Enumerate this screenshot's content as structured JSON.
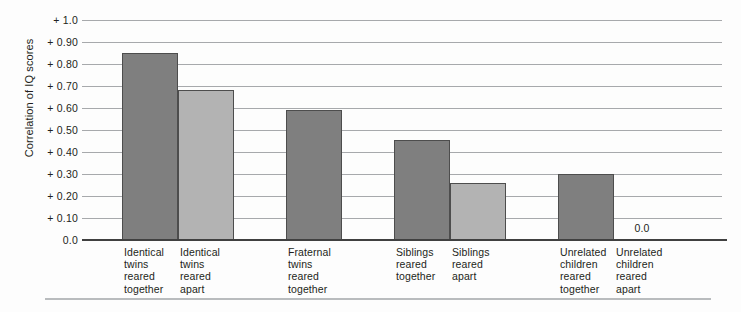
{
  "chart_data": {
    "type": "bar",
    "title": "",
    "xlabel": "",
    "ylabel": "Correlation of IQ scores",
    "ylim": [
      0.0,
      1.0
    ],
    "grid": true,
    "legend": "none",
    "ytick_labels": [
      "+ 1.0",
      "+ 0.90",
      "+ 0.80",
      "+ 0.70",
      "+ 0.60",
      "+ 0.50",
      "+ 0.40",
      "+ 0.30",
      "+ 0.20",
      "+ 0.10",
      "0.0"
    ],
    "ytick_values": [
      1.0,
      0.9,
      0.8,
      0.7,
      0.6,
      0.5,
      0.4,
      0.3,
      0.2,
      0.1,
      0.0
    ],
    "categories": [
      "Identical\ntwins\nreared\ntogether",
      "Identical\ntwins\nreared\napart",
      "Fraternal\ntwins\nreared\ntogether",
      "Siblings\nreared\ntogether",
      "Siblings\nreared\napart",
      "Unrelated\nchildren\nreared\ntogether",
      "Unrelated\nchildren\nreared\napart"
    ],
    "values": [
      0.85,
      0.68,
      0.59,
      0.455,
      0.26,
      0.3,
      0.0
    ],
    "value_labels": [
      "",
      "",
      "",
      "",
      "",
      "",
      "0.0"
    ],
    "bar_shades": [
      "dark",
      "light",
      "dark",
      "dark",
      "light",
      "dark",
      "dark"
    ],
    "colors": {
      "dark_bar": "#7f7f7f",
      "light_bar": "#b3b3b3",
      "bar_outline": "#4d4d4d",
      "gridline": "#a7a9ac",
      "axis": "#404040",
      "text": "#231f20",
      "background": "#fdfdfd",
      "bottom_rule": "#b9bcbe"
    },
    "layout": {
      "bar_left_px": [
        40,
        96,
        204,
        312,
        368,
        476,
        532
      ],
      "bar_width_px": 56,
      "plot_left_px": 82,
      "plot_top_px": 20,
      "plot_width_px": 640,
      "plot_height_px": 220
    }
  }
}
